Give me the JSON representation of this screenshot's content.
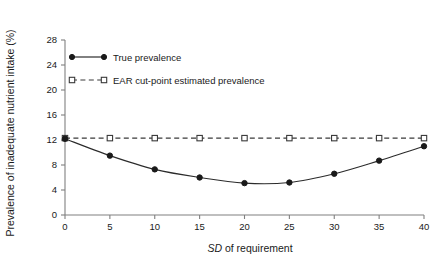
{
  "chart_data": {
    "type": "line",
    "title": "",
    "subtitle": "",
    "xlabel": "SD of requirement",
    "xlabel_italic_prefix": "SD",
    "xlabel_rest": " of requirement",
    "ylabel": "Prevalence of inadequate nutrient intake (%)",
    "x": [
      0,
      5,
      10,
      15,
      20,
      25,
      30,
      35,
      40
    ],
    "xlim": [
      0,
      40
    ],
    "ylim": [
      0,
      28
    ],
    "xticks": [
      "0",
      "5",
      "10",
      "15",
      "20",
      "25",
      "30",
      "35",
      "40"
    ],
    "yticks": [
      "0",
      "4",
      "8",
      "12",
      "16",
      "20",
      "24",
      "28"
    ],
    "grid": false,
    "legend_position": "upper-left-inside",
    "series": [
      {
        "name": "True prevalence",
        "marker": "filled-circle",
        "linestyle": "solid",
        "color": "#1a1a1a",
        "values": [
          12.2,
          9.5,
          7.3,
          6.0,
          5.1,
          5.2,
          6.6,
          8.7,
          11.0
        ]
      },
      {
        "name": "EAR cut-point estimated prevalence",
        "marker": "open-square",
        "linestyle": "dashed",
        "color": "#3a3a3a",
        "values": [
          12.3,
          12.3,
          12.3,
          12.3,
          12.3,
          12.3,
          12.3,
          12.3,
          12.3
        ]
      }
    ]
  },
  "legend": {
    "items": [
      {
        "label": "True prevalence"
      },
      {
        "label": "EAR cut-point estimated prevalence"
      }
    ]
  },
  "colors": {
    "axis": "#808080",
    "true_series": "#1a1a1a",
    "ear_series": "#3a3a3a",
    "background": "#ffffff"
  }
}
